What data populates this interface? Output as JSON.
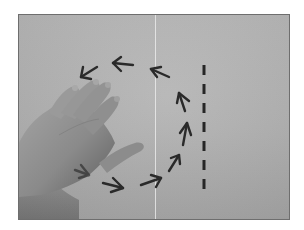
{
  "image": {
    "description": "Grayscale photograph of a hand resting on a sheet of paper; hand-drawn arrows trace a clockwise C-shaped path around the hand next to a vertical dashed line",
    "style": "grayscale photo",
    "colors": {
      "paper": "#b5b5b5",
      "frame_border": "#6e6e6e",
      "ink": "#2a2a2a",
      "skin_shadow": "#6f6f6f",
      "skin_highlight": "#9c9c9c"
    },
    "elements": {
      "hand": "open right hand, fingers pointing up-right, thumb extended toward right",
      "arrows": [
        {
          "position": "bottom-left near wrist",
          "direction": "right"
        },
        {
          "position": "bottom",
          "direction": "right"
        },
        {
          "position": "bottom-right",
          "direction": "up-right"
        },
        {
          "position": "right-lower",
          "direction": "up-right"
        },
        {
          "position": "right-middle",
          "direction": "up"
        },
        {
          "position": "right-upper",
          "direction": "up"
        },
        {
          "position": "top-right",
          "direction": "up-left"
        },
        {
          "position": "top-center",
          "direction": "left"
        },
        {
          "position": "top-left",
          "direction": "down-left"
        }
      ],
      "dashed_line": {
        "orientation": "vertical",
        "dash_count": 7
      },
      "fold_line": "thin light vertical crease through center of paper"
    }
  }
}
